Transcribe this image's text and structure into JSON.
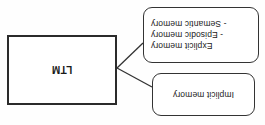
{
  "diagram": {
    "orientation": "rotated-180",
    "background_color": "#fefefe",
    "line_color": "#333333",
    "text_color": "#1a1a1a",
    "nodes": {
      "implicit": {
        "label": "Implicit memory",
        "shape": "rounded-rectangle",
        "border_color": "#333333"
      },
      "explicit": {
        "line1": "Explicit memory",
        "line2": "- Episodic memory",
        "line3": "- Semantic memory",
        "shape": "rounded-rectangle",
        "border_color": "#333333"
      },
      "ltm": {
        "label": "LTM",
        "shape": "rectangle",
        "border_color": "#2b2b2b"
      }
    },
    "connectors": [
      {
        "from": "implicit",
        "to": "ltm"
      },
      {
        "from": "explicit",
        "to": "ltm"
      }
    ]
  }
}
